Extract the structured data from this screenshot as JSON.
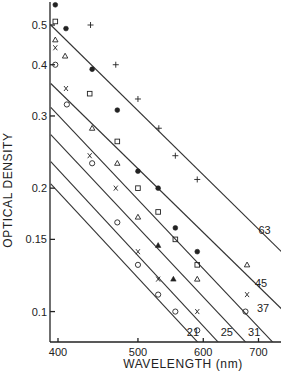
{
  "chart_data": {
    "type": "scatter",
    "title": "",
    "xlabel": "WAVELENGTH (nm)",
    "ylabel": "OPTICAL DENSITY",
    "xscale": "log",
    "yscale": "log",
    "xlim": [
      390,
      760
    ],
    "ylim": [
      0.078,
      0.56
    ],
    "grid": false,
    "legend": "none (lines labeled directly)",
    "x_ticks": [
      400,
      500,
      600,
      700
    ],
    "x_tick_labels": [
      "400",
      "500",
      "600",
      "700"
    ],
    "y_ticks": [
      0.1,
      0.15,
      0.2,
      0.3,
      0.4,
      0.5
    ],
    "y_tick_labels": [
      "0.1",
      "0.15",
      "0.2",
      "0.3",
      "0.4",
      "0.5"
    ],
    "series": [
      {
        "name": "plus",
        "marker": "+",
        "x": [
          438,
          470,
          500,
          530,
          555,
          590
        ],
        "y": [
          0.5,
          0.4,
          0.33,
          0.28,
          0.24,
          0.21
        ]
      },
      {
        "name": "filled-circle",
        "marker": "●",
        "x": [
          397,
          409,
          440,
          472,
          500,
          529,
          555,
          590
        ],
        "y": [
          0.56,
          0.49,
          0.39,
          0.31,
          0.22,
          0.2,
          0.16,
          0.14
        ]
      },
      {
        "name": "open-square",
        "marker": "□",
        "x": [
          397,
          437,
          472,
          500,
          529,
          555,
          590
        ],
        "y": [
          0.51,
          0.34,
          0.26,
          0.2,
          0.175,
          0.15,
          0.13
        ]
      },
      {
        "name": "open-triangle",
        "marker": "△",
        "x": [
          397,
          408,
          440,
          472,
          500,
          590,
          678
        ],
        "y": [
          0.46,
          0.42,
          0.28,
          0.23,
          0.17,
          0.12,
          0.13
        ]
      },
      {
        "name": "filled-triangle",
        "marker": "▲",
        "x": [
          529,
          552
        ],
        "y": [
          0.145,
          0.12
        ]
      },
      {
        "name": "cross",
        "marker": "x",
        "x": [
          397,
          409,
          437,
          470,
          500,
          529,
          590,
          678
        ],
        "y": [
          0.44,
          0.35,
          0.24,
          0.2,
          0.14,
          0.12,
          0.1,
          0.11
        ]
      },
      {
        "name": "open-circle",
        "marker": "○",
        "x": [
          397,
          410,
          440,
          472,
          500,
          529,
          555,
          590,
          675
        ],
        "y": [
          0.4,
          0.32,
          0.23,
          0.165,
          0.13,
          0.11,
          0.1,
          0.09,
          0.1
        ]
      }
    ],
    "fit_lines": [
      {
        "label": "63",
        "x": [
          392,
          760
        ],
        "y": [
          0.5,
          0.135
        ]
      },
      {
        "label": "45",
        "x": [
          392,
          760
        ],
        "y": [
          0.36,
          0.098
        ]
      },
      {
        "label": "37",
        "x": [
          392,
          755
        ],
        "y": [
          0.315,
          0.078
        ]
      },
      {
        "label": "31",
        "x": [
          392,
          700
        ],
        "y": [
          0.27,
          0.078
        ]
      },
      {
        "label": "25",
        "x": [
          392,
          648
        ],
        "y": [
          0.232,
          0.078
        ]
      },
      {
        "label": "21",
        "x": [
          392,
          612
        ],
        "y": [
          0.205,
          0.078
        ]
      }
    ],
    "annotations": [
      {
        "text": "63",
        "x": 700,
        "y": 0.155
      },
      {
        "text": "45",
        "x": 693,
        "y": 0.115
      },
      {
        "text": "37",
        "x": 697,
        "y": 0.1
      },
      {
        "text": "31",
        "x": 680,
        "y": 0.087
      },
      {
        "text": "25",
        "x": 630,
        "y": 0.087
      },
      {
        "text": "21",
        "x": 573,
        "y": 0.087
      }
    ]
  }
}
